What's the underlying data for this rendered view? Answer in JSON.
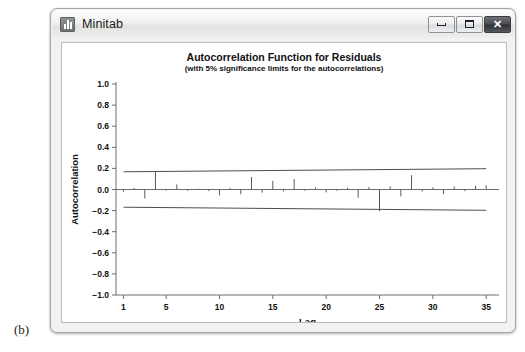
{
  "figure": {
    "label": "(b)"
  },
  "window": {
    "title": "Minitab",
    "icon": "bar-chart-icon",
    "controls": {
      "minimize": "minimize-icon",
      "maximize": "maximize-icon",
      "close": "✕"
    }
  },
  "chart_data": {
    "type": "bar",
    "title": "Autocorrelation Function for Residuals",
    "subtitle": "(with 5% significance limits for the autocorrelations)",
    "xlabel": "Lag",
    "ylabel": "Autocorrelation",
    "xlim": [
      0.3,
      36.2
    ],
    "ylim": [
      -1.0,
      1.0
    ],
    "grid": false,
    "legend": null,
    "x_ticks": [
      1,
      5,
      10,
      15,
      20,
      25,
      30,
      35
    ],
    "y_ticks": [
      1.0,
      0.8,
      0.6,
      0.4,
      0.2,
      0.0,
      -0.2,
      -0.4,
      -0.6,
      -0.8,
      -1.0
    ],
    "y_tick_labels": [
      "1.0",
      "0.8",
      "0.6",
      "0.4",
      "0.2",
      "0.0",
      "-0.2",
      "-0.4",
      "-0.6",
      "-0.8",
      "-1.0"
    ],
    "categories": [
      1,
      2,
      3,
      4,
      5,
      6,
      7,
      8,
      9,
      10,
      11,
      12,
      13,
      14,
      15,
      16,
      17,
      18,
      19,
      20,
      21,
      22,
      23,
      24,
      25,
      26,
      27,
      28,
      29,
      30,
      31,
      32,
      33,
      34,
      35
    ],
    "values": [
      -0.02,
      0.015,
      -0.085,
      0.172,
      -0.01,
      0.048,
      -0.012,
      0.008,
      -0.015,
      -0.055,
      0.012,
      -0.045,
      0.118,
      -0.03,
      0.082,
      -0.018,
      0.098,
      -0.012,
      0.02,
      -0.028,
      -0.012,
      0.015,
      -0.078,
      0.022,
      -0.205,
      0.03,
      -0.065,
      0.135,
      -0.018,
      0.02,
      -0.045,
      0.028,
      -0.015,
      0.035,
      0.04
    ],
    "significance_limits": {
      "upper_start": 0.168,
      "upper_end": 0.197,
      "lower_start": -0.168,
      "lower_end": -0.197,
      "level": "5%"
    }
  }
}
